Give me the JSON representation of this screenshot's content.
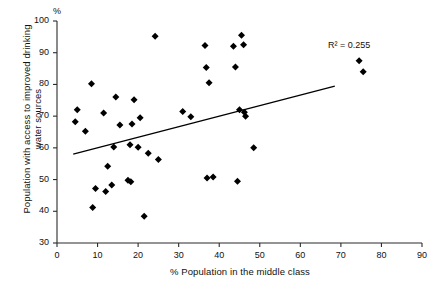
{
  "chart_data": {
    "type": "scatter",
    "title": "",
    "xlabel": "% Population in the middle class",
    "ylabel": "Population with access to improved drinking water sources",
    "ylabel_line1": "Population with access to improved drinking",
    "ylabel_line2": "water sources",
    "y_unit_label": "%",
    "xlim": [
      0,
      90
    ],
    "ylim": [
      30,
      100
    ],
    "xticks": [
      0,
      10,
      20,
      30,
      40,
      50,
      60,
      70,
      80,
      90
    ],
    "yticks": [
      30,
      40,
      50,
      60,
      70,
      80,
      90,
      100
    ],
    "grid": false,
    "legend": null,
    "marker": "diamond",
    "marker_color": "#000000",
    "annotations": [
      {
        "name": "r-squared",
        "text": "R² = 0.255",
        "x": 62,
        "y": 88
      }
    ],
    "trendline": {
      "type": "linear",
      "x_start": 4.0,
      "y_start": 58.0,
      "x_end": 68.5,
      "y_end": 79.5,
      "color": "#000000",
      "r_squared": 0.255
    },
    "points": [
      {
        "x": 4.5,
        "y": 68.2
      },
      {
        "x": 5.0,
        "y": 72.0
      },
      {
        "x": 7.0,
        "y": 65.2
      },
      {
        "x": 8.5,
        "y": 80.2
      },
      {
        "x": 8.8,
        "y": 41.2
      },
      {
        "x": 9.5,
        "y": 47.2
      },
      {
        "x": 11.5,
        "y": 71.0
      },
      {
        "x": 12.0,
        "y": 46.2
      },
      {
        "x": 12.5,
        "y": 54.2
      },
      {
        "x": 13.5,
        "y": 48.3
      },
      {
        "x": 14.0,
        "y": 60.3
      },
      {
        "x": 14.5,
        "y": 76.0
      },
      {
        "x": 15.5,
        "y": 67.2
      },
      {
        "x": 17.5,
        "y": 49.8
      },
      {
        "x": 18.0,
        "y": 61.0
      },
      {
        "x": 18.2,
        "y": 49.3
      },
      {
        "x": 18.5,
        "y": 67.5
      },
      {
        "x": 19.0,
        "y": 75.2
      },
      {
        "x": 20.0,
        "y": 60.2
      },
      {
        "x": 20.5,
        "y": 69.5
      },
      {
        "x": 21.5,
        "y": 38.4
      },
      {
        "x": 22.5,
        "y": 58.3
      },
      {
        "x": 24.2,
        "y": 95.2
      },
      {
        "x": 25.0,
        "y": 56.3
      },
      {
        "x": 31.0,
        "y": 71.5
      },
      {
        "x": 33.0,
        "y": 69.8
      },
      {
        "x": 36.5,
        "y": 92.3
      },
      {
        "x": 36.8,
        "y": 85.3
      },
      {
        "x": 37.0,
        "y": 50.5
      },
      {
        "x": 37.5,
        "y": 80.5
      },
      {
        "x": 38.5,
        "y": 50.8
      },
      {
        "x": 43.5,
        "y": 92.0
      },
      {
        "x": 44.0,
        "y": 85.5
      },
      {
        "x": 44.5,
        "y": 49.5
      },
      {
        "x": 45.0,
        "y": 72.0
      },
      {
        "x": 45.5,
        "y": 95.5
      },
      {
        "x": 46.0,
        "y": 92.5
      },
      {
        "x": 46.2,
        "y": 71.2
      },
      {
        "x": 46.5,
        "y": 70.0
      },
      {
        "x": 48.5,
        "y": 60.0
      },
      {
        "x": 74.5,
        "y": 87.5
      },
      {
        "x": 75.5,
        "y": 84.0
      }
    ]
  }
}
